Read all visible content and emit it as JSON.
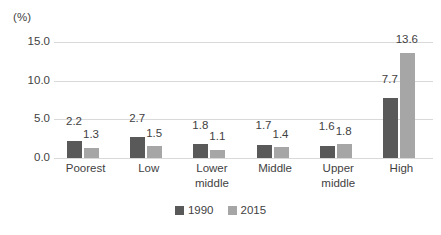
{
  "chart_data": {
    "type": "bar",
    "title": "",
    "xlabel": "",
    "ylabel": "(%)",
    "categories": [
      "Poorest",
      "Low",
      "Lower middle",
      "Middle",
      "Upper middle",
      "High"
    ],
    "series": [
      {
        "name": "1990",
        "color": "#595959",
        "values": [
          2.2,
          2.7,
          1.8,
          1.7,
          1.6,
          7.7
        ]
      },
      {
        "name": "2015",
        "color": "#a6a6a6",
        "values": [
          1.3,
          1.5,
          1.1,
          1.4,
          1.8,
          13.6
        ]
      }
    ],
    "ylim": [
      0,
      15
    ],
    "yticks": [
      "0.0",
      "5.0",
      "10.0",
      "15.0"
    ],
    "ytick_values": [
      0,
      5,
      10,
      15
    ],
    "grid": true,
    "legend_position": "bottom"
  },
  "axis": {
    "unit_label": "(%)"
  },
  "categories_wrapped": [
    [
      "Poorest"
    ],
    [
      "Low"
    ],
    [
      "Lower",
      "middle"
    ],
    [
      "Middle"
    ],
    [
      "Upper",
      "middle"
    ],
    [
      "High"
    ]
  ]
}
